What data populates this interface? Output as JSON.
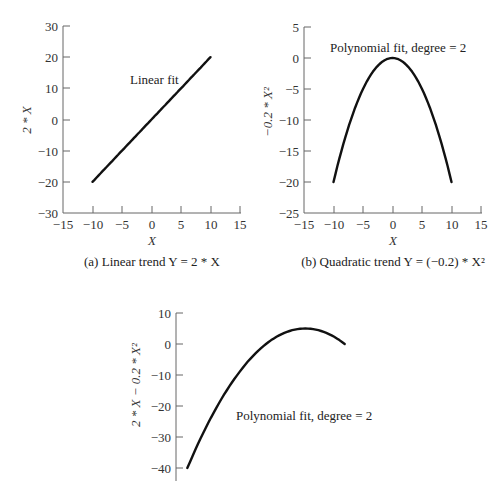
{
  "chart_data": [
    {
      "type": "line",
      "panel": "a",
      "title": "(a) Linear trend Y = 2*X",
      "caption_parts": {
        "prefix": "(a) Linear trend ",
        "var": "Y",
        "eq": " = 2*",
        "var2": "X"
      },
      "xlabel": "X",
      "ylabel": "2*X",
      "annotation": "Linear fit",
      "xlim": [
        -15,
        15
      ],
      "ylim": [
        -30,
        30
      ],
      "xticks": [
        -15,
        -10,
        -5,
        0,
        5,
        10,
        15
      ],
      "yticks": [
        -30,
        -20,
        -10,
        0,
        10,
        20,
        30
      ],
      "grid": false,
      "series": [
        {
          "name": "Linear fit",
          "x": [
            -10,
            10
          ],
          "y": [
            -20,
            20
          ]
        }
      ]
    },
    {
      "type": "line",
      "panel": "b",
      "title": "(b) Quadratic trend Y = (-0.2)*X^2",
      "xlabel": "X",
      "ylabel": "-0.2*X^2",
      "annotation": "Polynomial fit, degree = 2",
      "xlim": [
        -15,
        15
      ],
      "ylim": [
        -25,
        5
      ],
      "xticks": [
        -15,
        -10,
        -5,
        0,
        5,
        10,
        15
      ],
      "yticks": [
        -25,
        -20,
        -15,
        -10,
        -5,
        0,
        5
      ],
      "grid": false,
      "series": [
        {
          "name": "Polynomial fit, degree = 2",
          "x": [
            -10,
            -7.5,
            -5,
            -2.5,
            0,
            2.5,
            5,
            7.5,
            10
          ],
          "y": [
            -20,
            -11.25,
            -5,
            -1.25,
            0,
            -1.25,
            -5,
            -11.25,
            -20
          ]
        }
      ]
    },
    {
      "type": "line",
      "panel": "c",
      "title": "",
      "xlabel": "",
      "ylabel": "2*X - 0.2*X^2",
      "annotation": "Polynomial fit, degree = 2",
      "xlim": [
        -15,
        15
      ],
      "ylim": [
        -40,
        10
      ],
      "xticks": [],
      "yticks": [
        -40,
        -30,
        -20,
        -10,
        0,
        10
      ],
      "grid": false,
      "series": [
        {
          "name": "Polynomial fit, degree = 2",
          "x": [
            -10,
            -7.5,
            -5,
            -2.5,
            0,
            2.5,
            5,
            7.5,
            10
          ],
          "y": [
            -40,
            -26.25,
            -15,
            -6.25,
            0,
            3.75,
            5,
            3.75,
            0
          ]
        }
      ]
    }
  ],
  "labels": {
    "a": {
      "yticks": [
        "30",
        "20",
        "10",
        "0",
        "−10",
        "−20",
        "−30"
      ],
      "xticks": [
        "−15",
        "−10",
        "−5",
        "0",
        "5",
        "10",
        "15"
      ],
      "ylabel": "2 * X",
      "xlabel": "X",
      "annotation": "Linear fit",
      "caption": "(a) Linear trend Y = 2 * X"
    },
    "b": {
      "yticks": [
        "5",
        "0",
        "−5",
        "−10",
        "−15",
        "−20",
        "−25"
      ],
      "xticks": [
        "−15",
        "−10",
        "−5",
        "0",
        "5",
        "10",
        "15"
      ],
      "ylabel": "−0.2 * X²",
      "xlabel": "X",
      "annotation": "Polynomial fit, degree = 2",
      "caption": "(b) Quadratic trend Y = (−0.2) * X²"
    },
    "c": {
      "yticks": [
        "10",
        "0",
        "−10",
        "−20",
        "−30",
        "−40"
      ],
      "ylabel": "2 * X − 0.2 * X²",
      "annotation": "Polynomial fit, degree = 2"
    }
  }
}
